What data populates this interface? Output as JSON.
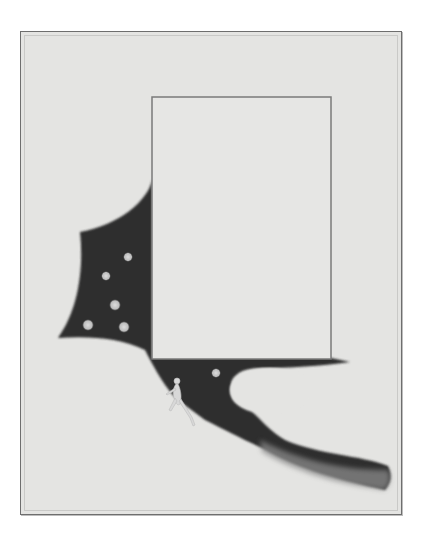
{
  "artwork": {
    "description": "Watercolor on paper: a dark night-sky shape with pale stars framing an empty ruled rectangle; a small nude figure walks up a pale slope at lower center.",
    "palette": {
      "paper": "#e4e4e2",
      "frame_line": "#6e6e6e",
      "sky_dark": "#2e2e2e",
      "sky_wash": "#7a7a7a",
      "star": "#cfcfcf",
      "figure": "#d6d6d6"
    },
    "stars": [
      {
        "x": 128,
        "y": 257
      },
      {
        "x": 106,
        "y": 276
      },
      {
        "x": 115,
        "y": 305
      },
      {
        "x": 88,
        "y": 325
      },
      {
        "x": 124,
        "y": 327
      },
      {
        "x": 215,
        "y": 373
      }
    ],
    "inner_panel": {
      "x": 152,
      "y": 97,
      "width": 179,
      "height": 262
    },
    "ghost_text": "",
    "signature": ""
  }
}
